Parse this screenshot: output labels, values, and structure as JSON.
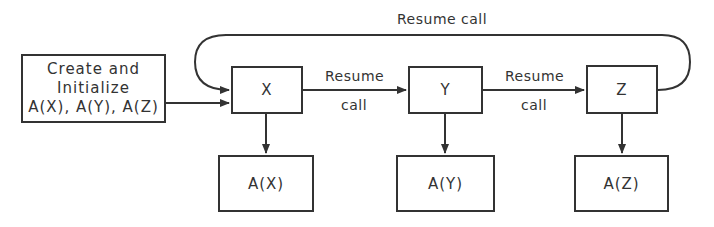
{
  "diagram": {
    "type": "coroutine-flow",
    "init_box": {
      "lines": [
        "Create and",
        "Initialize",
        "A(X), A(Y), A(Z)"
      ]
    },
    "coroutines": [
      {
        "id": "X",
        "label": "X",
        "activation": "A(X)"
      },
      {
        "id": "Y",
        "label": "Y",
        "activation": "A(Y)"
      },
      {
        "id": "Z",
        "label": "Z",
        "activation": "A(Z)"
      }
    ],
    "edges": [
      {
        "from": "init",
        "to": "X",
        "label": ""
      },
      {
        "from": "X",
        "to": "Y",
        "label_top": "Resume",
        "label_bottom": "call"
      },
      {
        "from": "Y",
        "to": "Z",
        "label_top": "Resume",
        "label_bottom": "call"
      },
      {
        "from": "Z",
        "to": "X",
        "label": "Resume call"
      },
      {
        "from": "X",
        "to": "A(X)",
        "label": ""
      },
      {
        "from": "Y",
        "to": "A(Y)",
        "label": ""
      },
      {
        "from": "Z",
        "to": "A(Z)",
        "label": ""
      }
    ],
    "colors": {
      "stroke": "#333333",
      "background": "#ffffff"
    }
  }
}
